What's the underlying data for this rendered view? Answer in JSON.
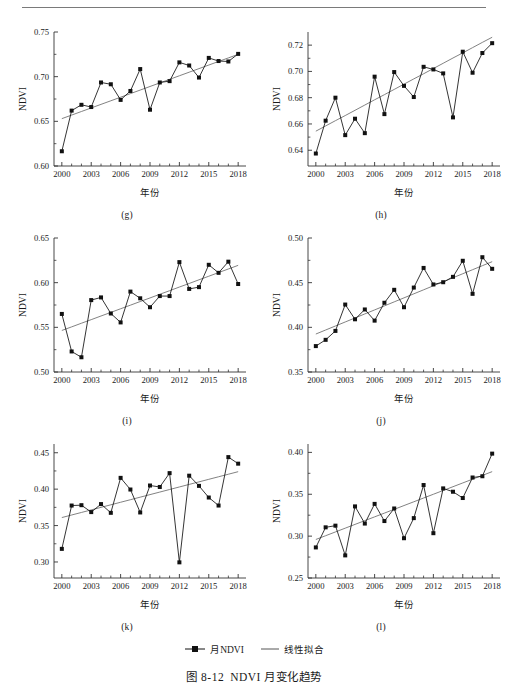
{
  "figure": {
    "caption_number": "图 8-12",
    "caption_text": "NDVI 月变化趋势"
  },
  "legend": {
    "series_label": "月NDVI",
    "trend_label": "线性拟合",
    "marker_icon": "filled-square-marker",
    "line_icon": "straight-line"
  },
  "axis": {
    "ylabel": "NDVI",
    "xlabel": "年份",
    "xticks": [
      "2000",
      "2003",
      "2006",
      "2009",
      "2012",
      "2015",
      "2018"
    ],
    "xlim": [
      1999.2,
      2018.8
    ]
  },
  "chart_data": [
    {
      "type": "line",
      "panel": "(g)",
      "title": "",
      "xlabel": "年份",
      "ylabel": "NDVI",
      "xlim": [
        1999.2,
        2018.8
      ],
      "ylim": [
        0.6,
        0.75
      ],
      "yticks": [
        0.6,
        0.65,
        0.7,
        0.75
      ],
      "yticklabels": [
        "0.60",
        "0.65",
        "0.70",
        "0.75"
      ],
      "xticks": [
        2000,
        2003,
        2006,
        2009,
        2012,
        2015,
        2018
      ],
      "xticklabels": [
        "2000",
        "2003",
        "2006",
        "2009",
        "2012",
        "2015",
        "2018"
      ],
      "grid": false,
      "legend_position": "figure-bottom",
      "x": [
        2000,
        2001,
        2002,
        2003,
        2004,
        2005,
        2006,
        2007,
        2008,
        2009,
        2010,
        2011,
        2012,
        2013,
        2014,
        2015,
        2016,
        2017,
        2018
      ],
      "series": [
        {
          "name": "月NDVI",
          "values": [
            0.6165,
            0.662,
            0.6685,
            0.666,
            0.6935,
            0.6915,
            0.674,
            0.684,
            0.7085,
            0.663,
            0.6935,
            0.695,
            0.716,
            0.7125,
            0.699,
            0.721,
            0.7175,
            0.717,
            0.7255
          ]
        },
        {
          "name": "线性拟合",
          "values": [
            0.653,
            0.657,
            0.661,
            0.665,
            0.669,
            0.673,
            0.677,
            0.681,
            0.685,
            0.689,
            0.693,
            0.697,
            0.701,
            0.705,
            0.709,
            0.713,
            0.717,
            0.721,
            0.725
          ]
        }
      ]
    },
    {
      "type": "line",
      "panel": "(h)",
      "title": "",
      "xlabel": "年份",
      "ylabel": "NDVI",
      "xlim": [
        1999.2,
        2018.8
      ],
      "ylim": [
        0.628,
        0.73
      ],
      "yticks": [
        0.64,
        0.66,
        0.68,
        0.7,
        0.72
      ],
      "yticklabels": [
        "0.64",
        "0.66",
        "0.68",
        "0.70",
        "0.72"
      ],
      "xticks": [
        2000,
        2003,
        2006,
        2009,
        2012,
        2015,
        2018
      ],
      "xticklabels": [
        "2000",
        "2003",
        "2006",
        "2009",
        "2012",
        "2015",
        "2018"
      ],
      "grid": false,
      "legend_position": "figure-bottom",
      "x": [
        2000,
        2001,
        2002,
        2003,
        2004,
        2005,
        2006,
        2007,
        2008,
        2009,
        2010,
        2011,
        2012,
        2013,
        2014,
        2015,
        2016,
        2017,
        2018
      ],
      "series": [
        {
          "name": "月NDVI",
          "values": [
            0.6375,
            0.6625,
            0.68,
            0.6515,
            0.664,
            0.653,
            0.696,
            0.6675,
            0.6995,
            0.689,
            0.6805,
            0.7035,
            0.7015,
            0.6985,
            0.665,
            0.715,
            0.699,
            0.714,
            0.7215
          ]
        },
        {
          "name": "线性拟合",
          "values": [
            0.6545,
            0.6585,
            0.6625,
            0.6664,
            0.6704,
            0.6744,
            0.6784,
            0.6823,
            0.6863,
            0.6903,
            0.6943,
            0.6982,
            0.7022,
            0.7062,
            0.7102,
            0.7141,
            0.7181,
            0.7221,
            0.726
          ]
        }
      ]
    },
    {
      "type": "line",
      "panel": "(i)",
      "title": "",
      "xlabel": "年份",
      "ylabel": "NDVI",
      "xlim": [
        1999.2,
        2018.8
      ],
      "ylim": [
        0.5,
        0.65
      ],
      "yticks": [
        0.5,
        0.55,
        0.6,
        0.65
      ],
      "yticklabels": [
        "0.50",
        "0.55",
        "0.60",
        "0.65"
      ],
      "xticks": [
        2000,
        2003,
        2006,
        2009,
        2012,
        2015,
        2018
      ],
      "xticklabels": [
        "2000",
        "2003",
        "2006",
        "2009",
        "2012",
        "2015",
        "2018"
      ],
      "grid": false,
      "legend_position": "figure-bottom",
      "x": [
        2000,
        2001,
        2002,
        2003,
        2004,
        2005,
        2006,
        2007,
        2008,
        2009,
        2010,
        2011,
        2012,
        2013,
        2014,
        2015,
        2016,
        2017,
        2018
      ],
      "series": [
        {
          "name": "月NDVI",
          "values": [
            0.565,
            0.523,
            0.5165,
            0.5805,
            0.5835,
            0.5655,
            0.5555,
            0.59,
            0.5825,
            0.5725,
            0.585,
            0.585,
            0.623,
            0.593,
            0.595,
            0.62,
            0.611,
            0.6235,
            0.5985
          ]
        },
        {
          "name": "线性拟合",
          "values": [
            0.5465,
            0.5505,
            0.5546,
            0.5586,
            0.5627,
            0.5667,
            0.5708,
            0.5748,
            0.5789,
            0.5829,
            0.587,
            0.591,
            0.5951,
            0.5991,
            0.6032,
            0.6072,
            0.6113,
            0.6153,
            0.6194
          ]
        }
      ]
    },
    {
      "type": "line",
      "panel": "(j)",
      "title": "",
      "xlabel": "年份",
      "ylabel": "NDVI",
      "xlim": [
        1999.2,
        2018.8
      ],
      "ylim": [
        0.35,
        0.5
      ],
      "yticks": [
        0.35,
        0.4,
        0.45,
        0.5
      ],
      "yticklabels": [
        "0.35",
        "0.40",
        "0.45",
        "0.50"
      ],
      "xticks": [
        2000,
        2003,
        2006,
        2009,
        2012,
        2015,
        2018
      ],
      "xticklabels": [
        "2000",
        "2003",
        "2006",
        "2009",
        "2012",
        "2015",
        "2018"
      ],
      "grid": false,
      "legend_position": "figure-bottom",
      "x": [
        2000,
        2001,
        2002,
        2003,
        2004,
        2005,
        2006,
        2007,
        2008,
        2009,
        2010,
        2011,
        2012,
        2013,
        2014,
        2015,
        2016,
        2017,
        2018
      ],
      "series": [
        {
          "name": "月NDVI",
          "values": [
            0.379,
            0.386,
            0.396,
            0.4255,
            0.409,
            0.42,
            0.4075,
            0.4275,
            0.442,
            0.4225,
            0.4445,
            0.4665,
            0.448,
            0.4505,
            0.4565,
            0.4745,
            0.4375,
            0.4785,
            0.4655
          ]
        },
        {
          "name": "线性拟合",
          "values": [
            0.3925,
            0.397,
            0.4015,
            0.406,
            0.4105,
            0.415,
            0.4195,
            0.424,
            0.4285,
            0.433,
            0.4375,
            0.442,
            0.4465,
            0.451,
            0.4555,
            0.46,
            0.4645,
            0.469,
            0.4735
          ]
        }
      ]
    },
    {
      "type": "line",
      "panel": "(k)",
      "title": "",
      "xlabel": "年份",
      "ylabel": "NDVI",
      "xlim": [
        1999.2,
        2018.8
      ],
      "ylim": [
        0.278,
        0.462
      ],
      "yticks": [
        0.3,
        0.35,
        0.4,
        0.45
      ],
      "yticklabels": [
        "0.30",
        "0.35",
        "0.40",
        "0.45"
      ],
      "xticks": [
        2000,
        2003,
        2006,
        2009,
        2012,
        2015,
        2018
      ],
      "xticklabels": [
        "2000",
        "2003",
        "2006",
        "2009",
        "2012",
        "2015",
        "2018"
      ],
      "grid": false,
      "legend_position": "figure-bottom",
      "x": [
        2000,
        2001,
        2002,
        2003,
        2004,
        2005,
        2006,
        2007,
        2008,
        2009,
        2010,
        2011,
        2012,
        2013,
        2014,
        2015,
        2016,
        2017,
        2018
      ],
      "series": [
        {
          "name": "月NDVI",
          "values": [
            0.318,
            0.3775,
            0.378,
            0.3685,
            0.3795,
            0.3675,
            0.4155,
            0.3995,
            0.368,
            0.405,
            0.403,
            0.422,
            0.2995,
            0.4185,
            0.4045,
            0.3885,
            0.3775,
            0.444,
            0.435
          ]
        },
        {
          "name": "线性拟合",
          "values": [
            0.361,
            0.3645,
            0.368,
            0.3715,
            0.375,
            0.3785,
            0.382,
            0.3855,
            0.389,
            0.3925,
            0.396,
            0.3995,
            0.403,
            0.4065,
            0.41,
            0.4135,
            0.417,
            0.4205,
            0.424
          ]
        }
      ]
    },
    {
      "type": "line",
      "panel": "(l)",
      "title": "",
      "xlabel": "年份",
      "ylabel": "NDVI",
      "xlim": [
        1999.2,
        2018.8
      ],
      "ylim": [
        0.25,
        0.41
      ],
      "yticks": [
        0.25,
        0.3,
        0.35,
        0.4
      ],
      "yticklabels": [
        "0.25",
        "0.30",
        "0.35",
        "0.40"
      ],
      "xticks": [
        2000,
        2003,
        2006,
        2009,
        2012,
        2015,
        2018
      ],
      "xticklabels": [
        "2000",
        "2003",
        "2006",
        "2009",
        "2012",
        "2015",
        "2018"
      ],
      "grid": false,
      "legend_position": "figure-bottom",
      "x": [
        2000,
        2001,
        2002,
        2003,
        2004,
        2005,
        2006,
        2007,
        2008,
        2009,
        2010,
        2011,
        2012,
        2013,
        2014,
        2015,
        2016,
        2017,
        2018
      ],
      "series": [
        {
          "name": "月NDVI",
          "values": [
            0.2865,
            0.3105,
            0.3125,
            0.277,
            0.3355,
            0.315,
            0.3385,
            0.318,
            0.333,
            0.2975,
            0.3215,
            0.361,
            0.3035,
            0.357,
            0.353,
            0.3455,
            0.37,
            0.3715,
            0.3985
          ]
        },
        {
          "name": "线性拟合",
          "values": [
            0.296,
            0.3005,
            0.305,
            0.3095,
            0.314,
            0.3185,
            0.323,
            0.3275,
            0.332,
            0.3365,
            0.341,
            0.3455,
            0.35,
            0.3545,
            0.359,
            0.3635,
            0.368,
            0.3725,
            0.377
          ]
        }
      ]
    }
  ]
}
